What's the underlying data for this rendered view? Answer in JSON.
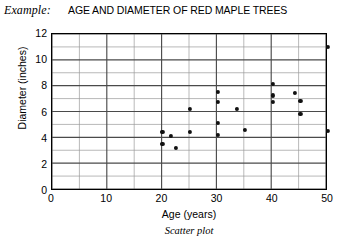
{
  "header": {
    "example_label": "Example:",
    "title": "AGE AND DIAMETER OF RED MAPLE TREES"
  },
  "caption": "Scatter plot",
  "axes": {
    "x_title": "Age (years)",
    "y_title": "Diameter (inches)",
    "x_ticks": [
      "0",
      "10",
      "20",
      "30",
      "40",
      "50"
    ],
    "y_ticks": [
      "0",
      "2",
      "4",
      "6",
      "8",
      "10",
      "12"
    ]
  },
  "colors": {
    "point": "#111111",
    "major_grid": "#4a4a4a",
    "minor_grid": "#9a9a9a",
    "frame": "#000000",
    "background": "#ffffff"
  },
  "chart_data": {
    "type": "scatter",
    "title": "AGE AND DIAMETER OF RED MAPLE TREES",
    "xlabel": "Age (years)",
    "ylabel": "Diameter (inches)",
    "xlim": [
      0,
      50
    ],
    "ylim": [
      0,
      12
    ],
    "x_major_ticks": [
      0,
      10,
      20,
      30,
      40,
      50
    ],
    "y_major_ticks": [
      0,
      2,
      4,
      6,
      8,
      10,
      12
    ],
    "x_minor_step": 5,
    "y_minor_step": 1,
    "grid": true,
    "legend": null,
    "points": [
      {
        "x": 20.0,
        "y": 4.5
      },
      {
        "x": 20.0,
        "y": 3.6
      },
      {
        "x": 21.5,
        "y": 4.2
      },
      {
        "x": 22.5,
        "y": 3.3
      },
      {
        "x": 25.0,
        "y": 6.3
      },
      {
        "x": 25.0,
        "y": 4.5
      },
      {
        "x": 30.0,
        "y": 7.6
      },
      {
        "x": 30.0,
        "y": 6.8
      },
      {
        "x": 30.0,
        "y": 5.2
      },
      {
        "x": 30.0,
        "y": 4.3
      },
      {
        "x": 33.5,
        "y": 6.3
      },
      {
        "x": 35.0,
        "y": 4.7
      },
      {
        "x": 40.0,
        "y": 8.2
      },
      {
        "x": 40.0,
        "y": 7.3
      },
      {
        "x": 40.0,
        "y": 6.8
      },
      {
        "x": 44.0,
        "y": 7.5
      },
      {
        "x": 45.0,
        "y": 6.9
      },
      {
        "x": 45.0,
        "y": 5.9
      },
      {
        "x": 50.0,
        "y": 11.0
      },
      {
        "x": 50.0,
        "y": 4.6
      }
    ]
  }
}
